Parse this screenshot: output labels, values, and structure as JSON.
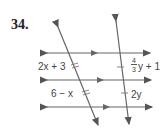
{
  "problem": {
    "number": "34.",
    "labels": {
      "left_top": "2x + 3",
      "left_bottom": "6 − x",
      "right_top_num": "4",
      "right_top_den": "3",
      "right_top_rest": "y + 1",
      "right_bottom": "2y"
    },
    "colors": {
      "line": "#555555",
      "text": "#444444"
    }
  }
}
